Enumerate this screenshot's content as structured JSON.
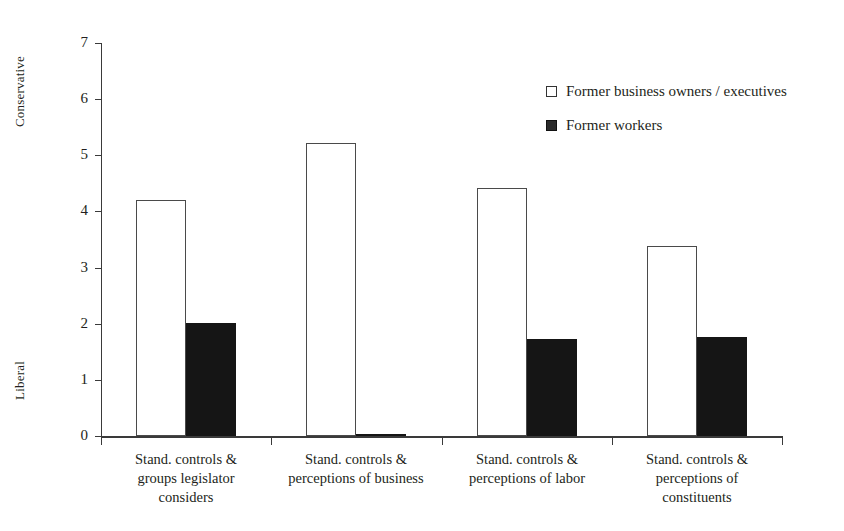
{
  "chart_data": {
    "type": "bar",
    "title": "",
    "xlabel": "",
    "ylabel": "",
    "ylim": [
      0,
      7
    ],
    "yticks": [
      "0",
      "1",
      "2",
      "3",
      "4",
      "5",
      "6",
      "7"
    ],
    "grid": false,
    "legend_position": "top-right",
    "axis_caption_top": "Conservative",
    "axis_caption_bottom": "Liberal",
    "categories": [
      "Stand. controls & groups legislator considers",
      "Stand. controls & perceptions of business",
      "Stand. controls & perceptions of labor",
      "Stand. controls & perceptions of constituents"
    ],
    "category_lines": [
      [
        "Stand. controls &",
        "groups legislator",
        "considers"
      ],
      [
        "Stand. controls &",
        "perceptions of business"
      ],
      [
        "Stand. controls &",
        "perceptions of labor"
      ],
      [
        "Stand. controls &",
        "perceptions of",
        "constituents"
      ]
    ],
    "series": [
      {
        "name": "Former business owners / executives",
        "color": "#ffffff",
        "edge_color": "#4a4a4a",
        "values": [
          4.2,
          5.22,
          4.42,
          3.38
        ]
      },
      {
        "name": "Former workers",
        "color": "#151515",
        "edge_color": "#151515",
        "values": [
          2.02,
          0.03,
          1.72,
          1.76
        ]
      }
    ]
  },
  "legend": {
    "items": [
      {
        "label": "Former business owners / executives",
        "swatch": "hollow-square"
      },
      {
        "label": "Former workers",
        "swatch": "filled-square"
      }
    ]
  }
}
